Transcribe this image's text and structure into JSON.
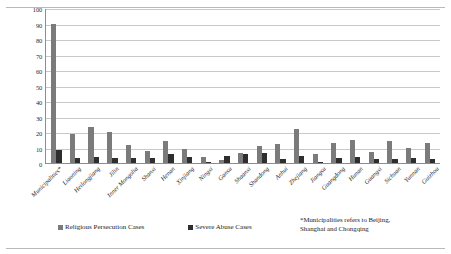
{
  "chart_data": {
    "type": "bar",
    "title": "",
    "xlabel": "",
    "ylabel": "",
    "ylim": [
      0,
      100
    ],
    "yticks": [
      0,
      10,
      20,
      30,
      40,
      50,
      60,
      70,
      80,
      90,
      100
    ],
    "grid": true,
    "legend_position": "bottom",
    "categories": [
      "Municipalities*",
      "Liaoning",
      "Heilongjiang",
      "Jilin",
      "Inner Mongolia",
      "Shanxi",
      "Henan",
      "Xinjiang",
      "Ningxi",
      "Gansu",
      "Shaanxi",
      "Shandong",
      "Anhui",
      "Zhejiang",
      "Jiangsu",
      "Guangdong",
      "Hunan",
      "Guangxi",
      "Sichuan",
      "Yunnan",
      "Guizhou"
    ],
    "series": [
      {
        "name": "Religious Persecution Cases",
        "color": "#7b7b7b",
        "values": [
          90,
          18.5,
          23,
          20,
          11.5,
          7.5,
          14,
          9,
          4,
          2,
          6.5,
          11,
          12.5,
          22,
          6,
          13,
          15,
          7,
          14,
          10,
          13
        ]
      },
      {
        "name": "Severe Abuse Cases",
        "color": "#2e2e2e",
        "values": [
          8.5,
          3,
          4,
          3,
          3,
          3.5,
          6,
          4,
          0.5,
          4.5,
          5.5,
          6.5,
          2.5,
          4.5,
          0.5,
          3.5,
          4,
          2.5,
          2.5,
          3,
          2.5
        ]
      }
    ],
    "annotations": [
      "*Municipalities refers to Beijing, Shanghai and Chongqing"
    ]
  },
  "legend": {
    "items": [
      {
        "label": "Religious Persecution Cases"
      },
      {
        "label": "Severe Abuse Cases"
      }
    ]
  },
  "footnote": {
    "marker": "*",
    "line1": "Municipalities refers to Beijing,",
    "line2": "Shanghai and Chongqing"
  }
}
